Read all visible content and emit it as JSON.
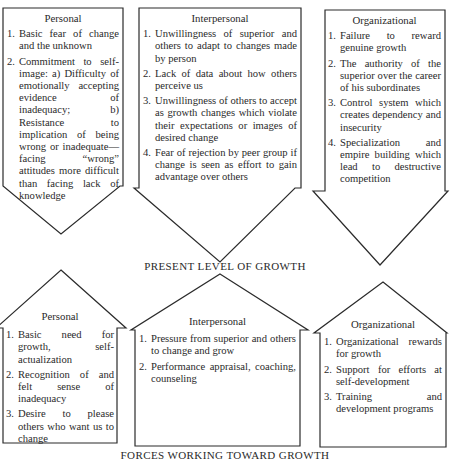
{
  "diagram": {
    "middle_label": "PRESENT LEVEL OF GROWTH",
    "bottom_label": "FORCES WORKING TOWARD GROWTH",
    "restraining_forces": {
      "personal": {
        "title": "Personal",
        "items": [
          {
            "num": "1.",
            "text": "Basic fear of change and the unknown"
          },
          {
            "num": "2.",
            "text": "Commitment to self-image: a) Difficulty of emotionally accepting evidence of inadequacy; b) Resistance to implication of being wrong or inadequate—facing “wrong” attitudes more difficult than facing lack of knowledge"
          }
        ]
      },
      "interpersonal": {
        "title": "Interpersonal",
        "items": [
          {
            "num": "1.",
            "text": "Unwillingness of superior and others to adapt to changes made by person"
          },
          {
            "num": "2.",
            "text": "Lack of data about how others perceive us"
          },
          {
            "num": "3.",
            "text": "Unwillingness of others to accept as growth changes which violate their expectations or images of desired change"
          },
          {
            "num": "4.",
            "text": "Fear of rejection by peer group if change is seen as effort to gain advantage over others"
          }
        ]
      },
      "organizational": {
        "title": "Organizational",
        "items": [
          {
            "num": "1.",
            "text": "Failure to reward genuine growth"
          },
          {
            "num": "2.",
            "text": "The authority of the superior over the career of his subordinates"
          },
          {
            "num": "3.",
            "text": "Control system which creates dependency and insecurity"
          },
          {
            "num": "4.",
            "text": "Specialization and empire building which lead to destructive competition"
          }
        ]
      }
    },
    "driving_forces": {
      "personal": {
        "title": "Personal",
        "items": [
          {
            "num": "1.",
            "text": "Basic need for growth, self-actualization"
          },
          {
            "num": "2.",
            "text": "Recognition of and felt sense of inadequacy"
          },
          {
            "num": "3.",
            "text": "Desire to please others who want us to change"
          }
        ]
      },
      "interpersonal": {
        "title": "Interpersonal",
        "items": [
          {
            "num": "1.",
            "text": "Pressure from superior and others to change and grow"
          },
          {
            "num": "2.",
            "text": "Performance appraisal, coaching, counseling"
          }
        ]
      },
      "organizational": {
        "title": "Organizational",
        "items": [
          {
            "num": "1.",
            "text": "Organizational rewards for growth"
          },
          {
            "num": "2.",
            "text": "Support for efforts at self-development"
          },
          {
            "num": "3.",
            "text": "Training and development programs"
          }
        ]
      }
    }
  }
}
